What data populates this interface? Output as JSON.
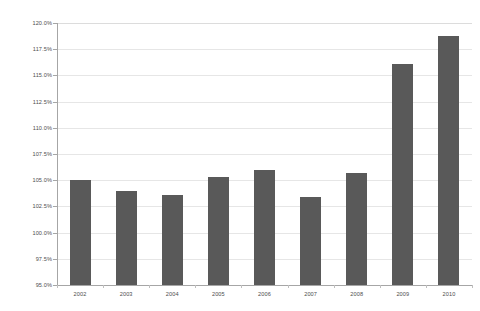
{
  "chart_data": {
    "type": "bar",
    "title": "",
    "subtitle": "",
    "xlabel": "",
    "ylabel": "",
    "categories": [
      "2002",
      "2003",
      "2004",
      "2005",
      "2006",
      "2007",
      "2008",
      "2009",
      "2010"
    ],
    "values": [
      105.0,
      104.0,
      103.6,
      105.3,
      106.0,
      103.4,
      105.7,
      116.1,
      118.8
    ],
    "ylim": [
      95.0,
      120.0
    ],
    "ytick_values": [
      95.0,
      97.5,
      100.0,
      102.5,
      105.0,
      107.5,
      110.0,
      112.5,
      115.0,
      117.5,
      120.0
    ],
    "ytick_labels": [
      "95.0%",
      "97.5%",
      "100.0%",
      "102.5%",
      "105.0%",
      "107.5%",
      "110.0%",
      "112.5%",
      "115.0%",
      "117.5%",
      "120.0%"
    ],
    "grid": true,
    "legend": false,
    "legend_position": "none",
    "series": [
      {
        "name": "",
        "values": [
          105.0,
          104.0,
          103.6,
          105.3,
          106.0,
          103.4,
          105.7,
          116.1,
          118.8
        ]
      }
    ],
    "colors": {
      "bar": "#595959",
      "gridline": "#e6e6e6",
      "axis": "#a6a6a6",
      "tick_label": "#4d4d4d",
      "background": "#ffffff"
    }
  }
}
